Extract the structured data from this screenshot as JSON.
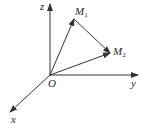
{
  "diagram": {
    "type": "3d-coordinate-vectors",
    "axes": {
      "z_label": "z",
      "y_label": "y",
      "x_label": "x",
      "origin_label": "O"
    },
    "points": [
      {
        "name": "M",
        "subscript": "1"
      },
      {
        "name": "M",
        "subscript": "2"
      }
    ],
    "vectors": [
      "O→M1",
      "O→M2",
      "M1→M2"
    ],
    "colors": {
      "stroke": "#333333",
      "background": "#ffffff"
    }
  }
}
